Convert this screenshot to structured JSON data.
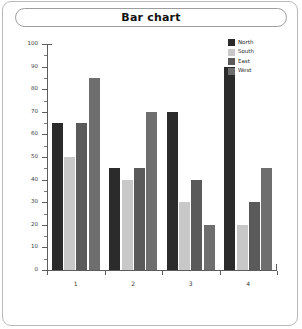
{
  "frame": {
    "border_color": "#b9b9b9",
    "background": "#ffffff"
  },
  "title": {
    "text": "Bar chart"
  },
  "legend": {
    "position": "top-right",
    "entries": [
      {
        "label": "North",
        "color": "#2b2b2b"
      },
      {
        "label": "South",
        "color": "#c8c8c8"
      },
      {
        "label": "East",
        "color": "#5a5a5a"
      },
      {
        "label": "West",
        "color": "#6e6e6e"
      }
    ]
  },
  "axes": {
    "y_ticks": [
      0,
      10,
      20,
      30,
      40,
      50,
      60,
      70,
      80,
      90,
      100
    ],
    "x_ticks": [
      "1",
      "2",
      "3",
      "4"
    ],
    "axis_color": "#5c5c5c"
  },
  "chart_data": {
    "type": "bar",
    "title": "Bar chart",
    "xlabel": "",
    "ylabel": "",
    "categories": [
      "1",
      "2",
      "3",
      "4"
    ],
    "series": [
      {
        "name": "North",
        "color": "#2b2b2b",
        "values": [
          65,
          45,
          70,
          90
        ]
      },
      {
        "name": "South",
        "color": "#c8c8c8",
        "values": [
          50,
          40,
          30,
          20
        ]
      },
      {
        "name": "East",
        "color": "#5a5a5a",
        "values": [
          65,
          45,
          40,
          30
        ]
      },
      {
        "name": "West",
        "color": "#6e6e6e",
        "values": [
          85,
          70,
          20,
          45
        ]
      }
    ],
    "ylim": [
      0,
      100
    ],
    "ytick_step": 10,
    "grid": false,
    "legend_position": "top-right"
  }
}
